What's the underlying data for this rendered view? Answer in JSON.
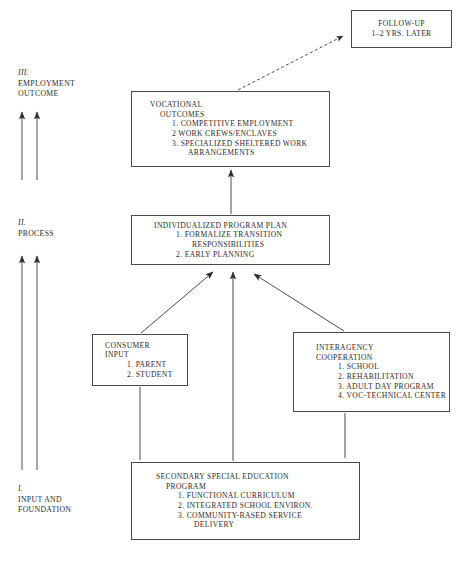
{
  "diagram": {
    "stages": [
      {
        "numeral": "III.",
        "name": "EMPLOYMENT",
        "name2": "OUTCOME"
      },
      {
        "numeral": "II.",
        "name": "PROCESS",
        "name2": ""
      },
      {
        "numeral": "I.",
        "name": "INPUT AND",
        "name2": "FOUNDATION"
      }
    ],
    "nodes": {
      "followup": {
        "title_lines": [
          "FOLLOW-UP",
          "1–2 YRS. LATER"
        ],
        "items": []
      },
      "vocational": {
        "title_lines": [
          "VOCATIONAL",
          "OUTCOMES"
        ],
        "items": [
          "1.  COMPETITIVE EMPLOYMENT",
          "2  WORK CREWS/ENCLAVES",
          "3.  SPECIALIZED SHELTERED WORK",
          "ARRANGEMENTS"
        ]
      },
      "ipp": {
        "title_lines": [
          "INDIVIDUALIZED PROGRAM PLAN"
        ],
        "items": [
          "1.  FORMALIZE TRANSITION",
          "RESPONSIBILITIES",
          "2.  EARLY PLANNING"
        ]
      },
      "consumer": {
        "title_lines": [
          "CONSUMER",
          "INPUT"
        ],
        "items": [
          "1.  PARENT",
          "2.  STUDENT"
        ]
      },
      "interagency": {
        "title_lines": [
          "INTERAGENCY",
          "COOPERATION"
        ],
        "items": [
          "1.  SCHOOL",
          "2.  REHABILITATION",
          "3.  ADULT DAY PROGRAM",
          "4.  VOC-TECHNICAL CENTER"
        ]
      },
      "secondary": {
        "title_lines": [
          "SECONDARY SPECIAL EDUCATION",
          "PROGRAM"
        ],
        "items": [
          "1.  FUNCTIONAL CURRICULUM",
          "2.  INTEGRATED SCHOOL ENVIRON.",
          "3.  COMMUNITY-BASED SERVICE",
          "DELIVERY"
        ]
      }
    },
    "connectors": [
      {
        "name": "vocational-to-followup",
        "style": "dashed",
        "arrow": true
      },
      {
        "name": "ipp-to-vocational",
        "style": "solid",
        "arrow": true
      },
      {
        "name": "consumer-to-ipp",
        "style": "solid",
        "arrow": true
      },
      {
        "name": "interagency-to-ipp",
        "style": "solid",
        "arrow": true
      },
      {
        "name": "secondary-to-ipp",
        "style": "solid",
        "arrow": true
      },
      {
        "name": "secondary-to-consumer",
        "style": "solid",
        "arrow": false
      },
      {
        "name": "secondary-to-interagency",
        "style": "solid",
        "arrow": false
      }
    ],
    "stage_arrows": {
      "count": 4,
      "description": "two vertical upward arrows per stage transition on left margin"
    },
    "colors": {
      "ink": "#2b2b2b",
      "line": "#4a4a4a",
      "background": "#ffffff"
    },
    "caption": ""
  }
}
